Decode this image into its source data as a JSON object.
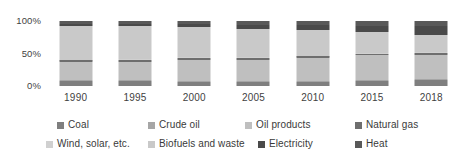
{
  "chart_data": {
    "type": "bar",
    "subtype": "stacked-100-percent",
    "title": "",
    "xlabel": "",
    "ylabel": "",
    "ylim": [
      0,
      100
    ],
    "y_ticks": [
      "0%",
      "50%",
      "100%"
    ],
    "y_tick_values": [
      0,
      50,
      100
    ],
    "grid": false,
    "legend_position": "bottom",
    "categories": [
      "1990",
      "1995",
      "2000",
      "2005",
      "2010",
      "2015",
      "2018"
    ],
    "series": [
      {
        "name": "Coal",
        "color": "#7f7f7f",
        "values": [
          8.0,
          7.0,
          5.5,
          5.5,
          6.0,
          7.0,
          9.0
        ]
      },
      {
        "name": "Crude oil",
        "color": "#a6a6a6",
        "values": [
          1.5,
          1.5,
          1.5,
          1.5,
          1.5,
          1.5,
          1.5
        ]
      },
      {
        "name": "Oil products",
        "color": "#bfbfbf",
        "values": [
          27.0,
          29.0,
          33.0,
          33.0,
          35.5,
          38.5,
          38.0
        ]
      },
      {
        "name": "Natural gas",
        "color": "#6e6e6e",
        "values": [
          3.0,
          3.0,
          3.0,
          3.0,
          3.0,
          3.0,
          3.0
        ]
      },
      {
        "name": "Wind, solar, etc.",
        "color": "#d0d0d0",
        "values": [
          1.0,
          1.0,
          1.0,
          1.0,
          1.0,
          1.0,
          1.0
        ]
      },
      {
        "name": "Biofuels and waste",
        "color": "#c9c9c9",
        "values": [
          52.5,
          50.5,
          47.0,
          44.0,
          39.0,
          32.0,
          25.5
        ]
      },
      {
        "name": "Electricity",
        "color": "#4a4a4a",
        "values": [
          3.0,
          3.5,
          4.5,
          6.0,
          7.5,
          9.5,
          14.0
        ]
      },
      {
        "name": "Heat",
        "color": "#595959",
        "values": [
          4.0,
          4.5,
          4.5,
          5.5,
          6.5,
          7.5,
          8.0
        ]
      }
    ]
  },
  "legend": {
    "row1": [
      "Coal",
      "Crude oil",
      "Oil products",
      "Natural gas"
    ],
    "row2": [
      "Wind, solar, etc.",
      "Biofuels and waste",
      "Electricity",
      "Heat"
    ]
  },
  "colors": {
    "background": "#ffffff",
    "text": "#3a3a3a",
    "coal": "#7f7f7f",
    "crude_oil": "#a6a6a6",
    "oil_products": "#bfbfbf",
    "natural_gas": "#6e6e6e",
    "wind_solar": "#d0d0d0",
    "biofuels_waste": "#c9c9c9",
    "electricity": "#4a4a4a",
    "heat": "#595959"
  }
}
